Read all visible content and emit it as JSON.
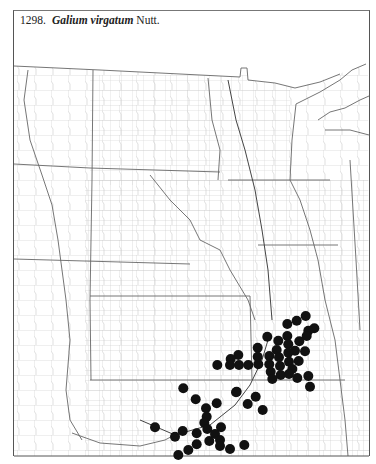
{
  "title": {
    "number": "1298.",
    "species": "Galium virgatum",
    "author": "Nutt."
  },
  "map": {
    "region": "Great Plains",
    "line_color": "#6a6a6a",
    "county_color": "#bdbdbd",
    "dot_color": "#111111",
    "dot_radius": 5
  },
  "dots": [
    [
      305.7,
      316
    ],
    [
      296.7,
      320.7
    ],
    [
      287.3,
      324
    ],
    [
      314.3,
      328.3
    ],
    [
      308.3,
      330.7
    ],
    [
      306.7,
      336
    ],
    [
      267.3,
      336.7
    ],
    [
      287.3,
      336
    ],
    [
      278.3,
      340.7
    ],
    [
      299.3,
      341.3
    ],
    [
      288.3,
      344.3
    ],
    [
      257.7,
      347.7
    ],
    [
      276.7,
      350
    ],
    [
      295,
      350.7
    ],
    [
      305,
      351.3
    ],
    [
      288.3,
      352.7
    ],
    [
      257.7,
      356.7
    ],
    [
      269.3,
      356
    ],
    [
      279,
      357.3
    ],
    [
      238.3,
      355
    ],
    [
      230.7,
      359
    ],
    [
      289,
      361.7
    ],
    [
      298.7,
      361
    ],
    [
      217.3,
      365
    ],
    [
      230,
      365
    ],
    [
      239,
      365
    ],
    [
      248.3,
      365
    ],
    [
      258.3,
      364.3
    ],
    [
      269.3,
      364.3
    ],
    [
      280,
      366
    ],
    [
      292.3,
      369
    ],
    [
      270.7,
      371.7
    ],
    [
      280.7,
      375
    ],
    [
      289,
      374
    ],
    [
      308.3,
      376
    ],
    [
      272.3,
      379
    ],
    [
      297.3,
      378
    ],
    [
      310,
      386.7
    ],
    [
      236.7,
      391.7
    ],
    [
      255.7,
      396.7
    ],
    [
      183.3,
      388.3
    ],
    [
      236,
      392.3
    ],
    [
      195.7,
      399.3
    ],
    [
      216.7,
      403.3
    ],
    [
      247.7,
      404
    ],
    [
      206,
      408.3
    ],
    [
      262.7,
      410
    ],
    [
      206.7,
      416.7
    ],
    [
      204.3,
      422.7
    ],
    [
      155,
      427.3
    ],
    [
      221,
      427.3
    ],
    [
      207.3,
      429
    ],
    [
      182.7,
      431
    ],
    [
      196.7,
      433.3
    ],
    [
      215,
      434
    ],
    [
      175,
      436.7
    ],
    [
      220,
      440
    ],
    [
      209.3,
      441
    ],
    [
      196.7,
      444.3
    ],
    [
      220,
      446
    ],
    [
      244.3,
      445
    ],
    [
      230,
      449
    ],
    [
      188.3,
      450
    ],
    [
      178.3,
      455
    ]
  ]
}
